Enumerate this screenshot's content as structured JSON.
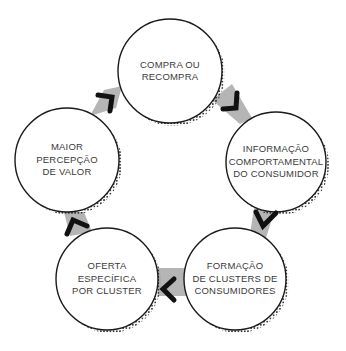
{
  "diagram": {
    "type": "cycle",
    "colors": {
      "circle_stroke": "#1a1a1a",
      "circle_fill": "#ffffff",
      "connector": "#b5b5b5",
      "arrow": "#111111",
      "text": "#3a3a3a",
      "dots": "#1a1a1a"
    },
    "nodes": [
      {
        "id": "compra",
        "lines": [
          "COMPRA OU",
          "RECOMPRA"
        ]
      },
      {
        "id": "informacao",
        "lines": [
          "INFORMAÇÃO",
          "COMPORTAMENTAL",
          "DO CONSUMIDOR"
        ]
      },
      {
        "id": "formacao",
        "lines": [
          "FORMAÇÃO",
          "DE CLUSTERS DE",
          "CONSUMIDORES"
        ]
      },
      {
        "id": "oferta",
        "lines": [
          "OFERTA",
          "ESPECÍFICA",
          "POR CLUSTER"
        ]
      },
      {
        "id": "percepcao",
        "lines": [
          "MAIOR",
          "PERCEPÇÃO",
          "DE VALOR"
        ]
      }
    ],
    "edges": [
      {
        "from": "compra",
        "to": "informacao"
      },
      {
        "from": "informacao",
        "to": "formacao"
      },
      {
        "from": "formacao",
        "to": "oferta"
      },
      {
        "from": "oferta",
        "to": "percepcao"
      },
      {
        "from": "percepcao",
        "to": "compra"
      }
    ]
  }
}
